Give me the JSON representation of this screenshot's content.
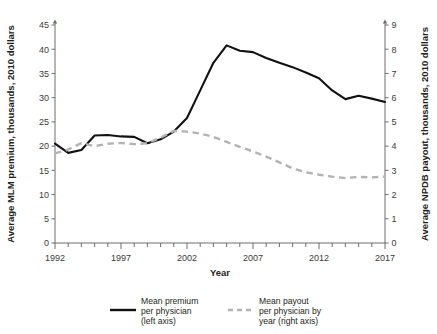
{
  "chart_data": {
    "type": "line",
    "title": "",
    "xlabel": "Year",
    "ylabel": "Average MLM premium, thousands, 2010 dollars",
    "y2label": "Average NPDB payout, thousands, 2010 dollars",
    "x": [
      1992,
      1993,
      1994,
      1995,
      1996,
      1997,
      1998,
      1999,
      2000,
      2001,
      2002,
      2003,
      2004,
      2005,
      2006,
      2007,
      2008,
      2009,
      2010,
      2011,
      2012,
      2013,
      2014,
      2015,
      2016,
      2017
    ],
    "xlim": [
      1992,
      2017
    ],
    "ylim": [
      0,
      45
    ],
    "y2lim": [
      0,
      9
    ],
    "xticks": [
      1992,
      1993,
      1994,
      1995,
      1996,
      1997,
      1998,
      1999,
      2000,
      2001,
      2002,
      2003,
      2004,
      2005,
      2006,
      2007,
      2008,
      2009,
      2010,
      2011,
      2012,
      2013,
      2014,
      2015,
      2016,
      2017
    ],
    "xtick_labels": [
      "1992",
      "",
      "",
      "",
      "",
      "1997",
      "",
      "",
      "",
      "",
      "2002",
      "",
      "",
      "",
      "",
      "2007",
      "",
      "",
      "",
      "",
      "2012",
      "",
      "",
      "",
      "",
      "2017"
    ],
    "yticks": [
      0,
      5,
      10,
      15,
      20,
      25,
      30,
      35,
      40,
      45
    ],
    "ytick_labels": [
      "0",
      "5",
      "10",
      "15",
      "20",
      "25",
      "30",
      "35",
      "40",
      "45"
    ],
    "y2ticks": [
      0,
      1,
      2,
      3,
      4,
      5,
      6,
      7,
      8,
      9
    ],
    "y2tick_labels": [
      "0",
      "1",
      "2",
      "3",
      "4",
      "5",
      "6",
      "7",
      "8",
      "9"
    ],
    "grid": false,
    "legend_position": "bottom",
    "series": [
      {
        "name": "Mean premium per physician (left axis)",
        "axis": "left",
        "style": "solid",
        "color": "#111111",
        "values": [
          20.5,
          18.6,
          19.2,
          22.2,
          22.3,
          22.0,
          21.9,
          20.6,
          21.4,
          23.0,
          25.8,
          31.5,
          37.2,
          40.8,
          39.7,
          39.4,
          38.2,
          37.2,
          36.3,
          35.2,
          34.0,
          31.5,
          29.7,
          30.4,
          29.8,
          29.1
        ]
      },
      {
        "name": "Mean payout per physician by year (right axis)",
        "axis": "right",
        "style": "dashed",
        "color": "#b3b3b3",
        "values": [
          3.7,
          3.86,
          4.12,
          4.0,
          4.1,
          4.13,
          4.08,
          4.12,
          4.35,
          4.63,
          4.6,
          4.52,
          4.38,
          4.17,
          3.97,
          3.78,
          3.57,
          3.33,
          3.08,
          2.92,
          2.82,
          2.74,
          2.68,
          2.73,
          2.71,
          2.74
        ]
      }
    ],
    "legend": [
      {
        "label_lines": [
          "Mean premium",
          "per physician",
          "(left axis)"
        ],
        "style": "solid"
      },
      {
        "label_lines": [
          "Mean payout",
          "per physician by",
          "year (right axis)"
        ],
        "style": "dashed"
      }
    ]
  }
}
